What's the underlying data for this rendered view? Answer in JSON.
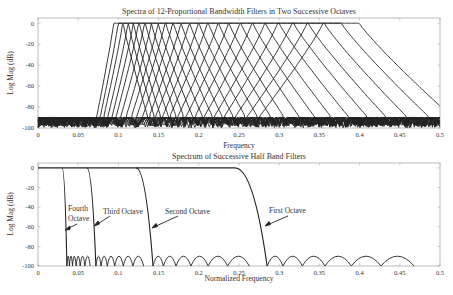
{
  "figure": {
    "top": {
      "title": "Spectra of 12-Proportional Bandwidth Filters in Two Successive Octaves",
      "xlabel": "Frequency",
      "ylabel": "Log Mag (dB)"
    },
    "bottom": {
      "title": "Spectrum of Successive Half Band Filters",
      "xlabel": "Normalized Frequency",
      "ylabel": "Log Mag (dB)",
      "annotations": [
        "Fourth Octave",
        "Third Octave",
        "Second Octave",
        "First Octave"
      ]
    }
  },
  "chart_data": [
    {
      "type": "line",
      "title": "Spectra of 12-Proportional Bandwidth Filters in Two Successive Octaves",
      "xlabel": "Frequency",
      "ylabel": "Log Mag (dB)",
      "xlim": [
        0,
        0.5
      ],
      "ylim": [
        -100,
        5
      ],
      "xticks": [
        "0",
        "0.05",
        "0.1",
        "0.15",
        "0.2",
        "0.25",
        "0.3",
        "0.35",
        "0.4",
        "0.45",
        "0.5"
      ],
      "yticks": [
        "0",
        "-20",
        "-40",
        "-60",
        "-80",
        "-100"
      ],
      "grid": false,
      "series_count": 24,
      "filter_center_frequencies": [
        0.1,
        0.106,
        0.112,
        0.119,
        0.126,
        0.133,
        0.141,
        0.15,
        0.159,
        0.168,
        0.178,
        0.189,
        0.2,
        0.212,
        0.224,
        0.238,
        0.252,
        0.267,
        0.283,
        0.3,
        0.317,
        0.336,
        0.356,
        0.377
      ],
      "passband_level_db": 0,
      "stopband_floor_db": -90
    },
    {
      "type": "line",
      "title": "Spectrum of Successive Half Band Filters",
      "xlabel": "Normalized Frequency",
      "ylabel": "Log Mag (dB)",
      "xlim": [
        0,
        0.5
      ],
      "ylim": [
        -100,
        5
      ],
      "xticks": [
        "0",
        "0.05",
        "0.1",
        "0.15",
        "0.2",
        "0.25",
        "0.3",
        "0.35",
        "0.4",
        "0.45",
        "0.5"
      ],
      "yticks": [
        "0",
        "-20",
        "-40",
        "-60",
        "-80",
        "-100"
      ],
      "grid": false,
      "series": [
        {
          "name": "Fourth Octave",
          "passband_edge": 0.03,
          "stopband_edge": 0.036
        },
        {
          "name": "Third Octave",
          "passband_edge": 0.061,
          "stopband_edge": 0.072
        },
        {
          "name": "Second Octave",
          "passband_edge": 0.122,
          "stopband_edge": 0.143
        },
        {
          "name": "First Octave",
          "passband_edge": 0.245,
          "stopband_edge": 0.285
        }
      ],
      "stopband_floor_db": -90
    }
  ]
}
